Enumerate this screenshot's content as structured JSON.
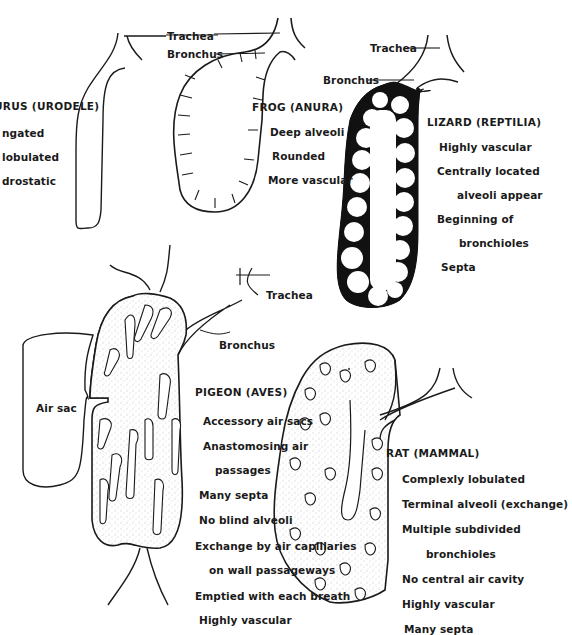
{
  "diagram": {
    "panels": [
      {
        "id": "necturus",
        "title": "NECTURUS (URODELE)",
        "title_visible": "URUS (URODELE)",
        "notes": [
          "Elongated",
          "Not lobulated",
          "Hydrostatic"
        ],
        "notes_visible": [
          "ngated",
          "lobulated",
          "drostatic"
        ]
      },
      {
        "id": "frog",
        "title": "FROG (ANURA)",
        "notes": [
          "Deep alveoli",
          "Rounded",
          "More vascular"
        ],
        "labels": {
          "trachea": "Trachea",
          "bronchus": "Bronchus"
        }
      },
      {
        "id": "lizard",
        "title": "LIZARD (REPTILIA)",
        "notes": [
          "Highly vascular",
          "Centrally located",
          "alveoli appear",
          "Beginning of",
          "bronchioles",
          "Septa"
        ],
        "labels": {
          "trachea": "Trachea",
          "bronchus": "Bronchus"
        }
      },
      {
        "id": "pigeon",
        "title": "PIGEON (AVES)",
        "notes": [
          "Accessory air sacs",
          "Anastomosing air",
          "passages",
          "Many septa",
          "No blind alveoli",
          "Exchange by air capillaries",
          "on wall passageways",
          "Emptied with each breath",
          "Highly vascular"
        ],
        "labels": {
          "trachea": "Trachea",
          "bronchus": "Bronchus",
          "air_sac": "Air sac"
        }
      },
      {
        "id": "rat",
        "title": "RAT (MAMMAL)",
        "notes": [
          "Complexly lobulated",
          "Terminal alveoli (exchange)",
          "Multiple subdivided",
          "bronchioles",
          "No central air cavity",
          "Highly vascular",
          "Many septa"
        ]
      }
    ]
  }
}
